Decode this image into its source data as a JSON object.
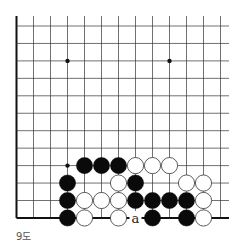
{
  "diagram": {
    "title": "9도",
    "grid": {
      "columns": 13,
      "rows": 12,
      "x0": 16.5,
      "y0": 26,
      "dx": 17,
      "dy": 17.45,
      "top_y": 16,
      "right_x": 229,
      "edges": {
        "left": true,
        "bottom": true,
        "top": false,
        "right": false
      }
    },
    "star_points": [
      {
        "col": 3,
        "row": 2
      },
      {
        "col": 9,
        "row": 2
      },
      {
        "col": 3,
        "row": 8
      }
    ],
    "stones": [
      {
        "col": 4,
        "row": 8,
        "color": "black"
      },
      {
        "col": 5,
        "row": 8,
        "color": "black"
      },
      {
        "col": 6,
        "row": 8,
        "color": "black"
      },
      {
        "col": 7,
        "row": 8,
        "color": "white"
      },
      {
        "col": 8,
        "row": 8,
        "color": "white"
      },
      {
        "col": 9,
        "row": 8,
        "color": "white"
      },
      {
        "col": 3,
        "row": 9,
        "color": "black"
      },
      {
        "col": 6,
        "row": 9,
        "color": "white"
      },
      {
        "col": 7,
        "row": 9,
        "color": "black"
      },
      {
        "col": 10,
        "row": 9,
        "color": "white"
      },
      {
        "col": 11,
        "row": 9,
        "color": "white"
      },
      {
        "col": 3,
        "row": 10,
        "color": "black"
      },
      {
        "col": 4,
        "row": 10,
        "color": "white"
      },
      {
        "col": 5,
        "row": 10,
        "color": "white"
      },
      {
        "col": 6,
        "row": 10,
        "color": "white"
      },
      {
        "col": 7,
        "row": 10,
        "color": "black"
      },
      {
        "col": 8,
        "row": 10,
        "color": "black"
      },
      {
        "col": 9,
        "row": 10,
        "color": "black"
      },
      {
        "col": 10,
        "row": 10,
        "color": "black"
      },
      {
        "col": 11,
        "row": 10,
        "color": "white"
      },
      {
        "col": 3,
        "row": 11,
        "color": "black"
      },
      {
        "col": 4,
        "row": 11,
        "color": "white"
      },
      {
        "col": 6,
        "row": 11,
        "color": "white"
      },
      {
        "col": 8,
        "row": 11,
        "color": "black"
      },
      {
        "col": 10,
        "row": 11,
        "color": "black"
      },
      {
        "col": 11,
        "row": 11,
        "color": "white"
      }
    ],
    "labels": [
      {
        "col": 7,
        "row": 11,
        "text": "a"
      }
    ],
    "colors": {
      "line": "#333333",
      "edge": "#111111",
      "black_stone": "#0a0a0a",
      "white_stone": "#ffffff",
      "white_stroke": "#333333",
      "caption": "#555555"
    }
  }
}
